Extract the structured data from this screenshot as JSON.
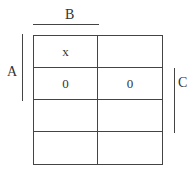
{
  "kmap": {
    "labels": {
      "top": "B",
      "left": "A",
      "right": "C"
    },
    "rows": [
      [
        "x",
        ""
      ],
      [
        "0",
        "0"
      ],
      [
        "",
        ""
      ],
      [
        "",
        ""
      ]
    ]
  }
}
